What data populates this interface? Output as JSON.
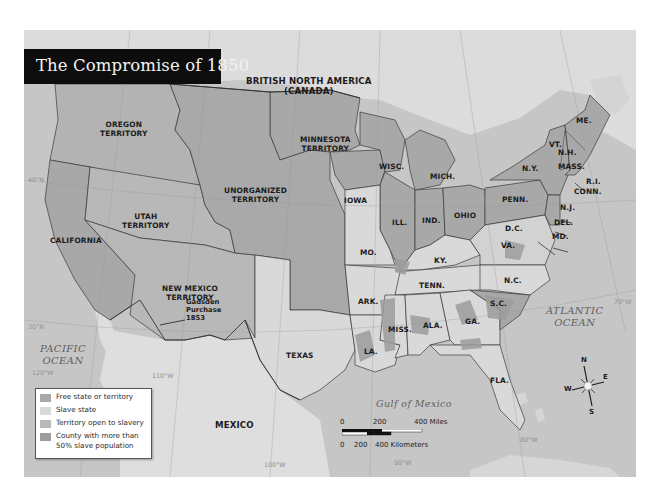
{
  "title": "The Compromise of 1850",
  "colors": {
    "free": "#a8a8a8",
    "slave": "#d9d9d9",
    "open_territory": "#b8b8b8",
    "slave_county": "#9d9d9d",
    "water": "#c4c4c4",
    "foreign_land": "#dedede",
    "border": "#3a3a3a",
    "title_bg": "#0d0d0d"
  },
  "regions": {
    "canada": "BRITISH NORTH AMERICA",
    "canada_sub": "(CANADA)",
    "oregon_1": "OREGON",
    "oregon_2": "TERRITORY",
    "minnesota_1": "MINNESOTA",
    "minnesota_2": "TERRITORY",
    "unorganized_1": "UNORGANIZED",
    "unorganized_2": "TERRITORY",
    "utah_1": "UTAH",
    "utah_2": "TERRITORY",
    "california": "CALIFORNIA",
    "new_mexico_1": "NEW MEXICO",
    "new_mexico_2": "TERRITORY",
    "gadsden_1": "Gadsden",
    "gadsden_2": "Purchase",
    "gadsden_3": "1853",
    "texas": "TEXAS",
    "mexico": "MEXICO",
    "iowa": "IOWA",
    "wisc": "WISC.",
    "mich": "MICH.",
    "ill": "ILL.",
    "ind": "IND.",
    "ohio": "OHIO",
    "mo": "MO.",
    "ky": "KY.",
    "ark": "ARK.",
    "tenn": "TENN.",
    "la": "LA.",
    "miss": "MISS.",
    "ala": "ALA.",
    "ga": "GA.",
    "fla": "FLA.",
    "sc": "S.C.",
    "nc": "N.C.",
    "va": "VA.",
    "dc": "D.C.",
    "md": "MD.",
    "del": "DEL.",
    "nj": "N.J.",
    "penn": "PENN.",
    "ny": "N.Y.",
    "vt": "VT.",
    "nh": "N.H.",
    "mass": "MASS.",
    "ri": "R.I.",
    "conn": "CONN.",
    "me": "ME."
  },
  "water_bodies": {
    "pacific_1": "PACIFIC",
    "pacific_2": "OCEAN",
    "atlantic_1": "ATLANTIC",
    "atlantic_2": "OCEAN",
    "gulf": "Gulf of Mexico"
  },
  "coordinates": {
    "w40": "40°N",
    "w30": "30°N",
    "w120": "120°W",
    "w110": "110°W",
    "w100": "100°W",
    "w90": "90°W",
    "w80": "80°W",
    "w70": "70°W"
  },
  "legend": {
    "items": [
      {
        "label": "Free state or territory",
        "color": "#a8a8a8"
      },
      {
        "label": "Slave state",
        "color": "#d9d9d9"
      },
      {
        "label": "Territory open to slavery",
        "color": "#b8b8b8"
      },
      {
        "label": "County with more than",
        "label2": "50% slave population",
        "color": "#9d9d9d"
      }
    ]
  },
  "scale_bar": {
    "miles_0": "0",
    "miles_200": "200",
    "miles_400": "400 Miles",
    "km_0": "0",
    "km_200": "200",
    "km_400": "400 Kilometers"
  },
  "compass": {
    "n": "N",
    "e": "E",
    "s": "S",
    "w": "W"
  }
}
